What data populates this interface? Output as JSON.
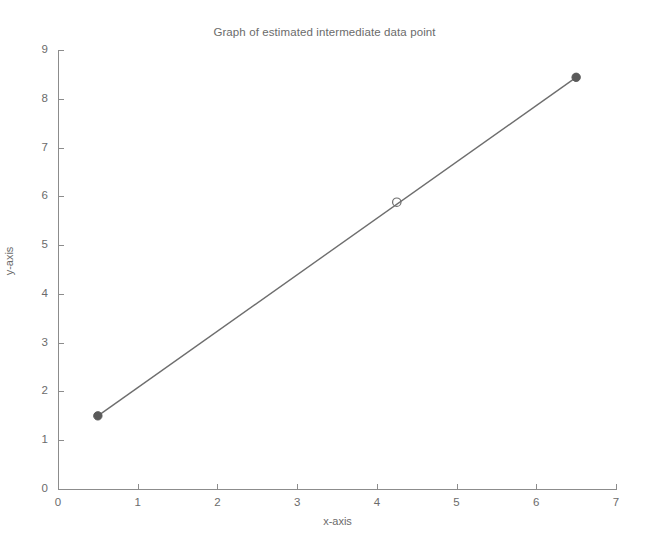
{
  "chart_data": {
    "type": "line",
    "title": "Graph of estimated intermediate data point",
    "xlabel": "x-axis",
    "ylabel": "y-axis",
    "xlim": [
      0,
      7
    ],
    "ylim": [
      0,
      9
    ],
    "xticks": [
      "0",
      "1",
      "2",
      "3",
      "4",
      "5",
      "6",
      "7"
    ],
    "yticks": [
      "0",
      "1",
      "2",
      "3",
      "4",
      "5",
      "6",
      "7",
      "8",
      "9"
    ],
    "grid": false,
    "legend": null,
    "series": [
      {
        "name": "known data points",
        "marker": "filled-circle",
        "color": "#5a5a5a",
        "line_color": "#6e6e6e",
        "x": [
          0.5,
          6.5
        ],
        "y": [
          1.5,
          8.44
        ]
      },
      {
        "name": "estimated intermediate data point",
        "marker": "open-circle",
        "color": "#6e6e6e",
        "x": [
          4.25
        ],
        "y": [
          5.88
        ]
      }
    ]
  },
  "figure": {
    "background": "#ffffff",
    "axis_color": "#8c8c8c",
    "text_color": "#6b6b6b"
  }
}
